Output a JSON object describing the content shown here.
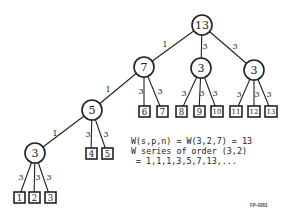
{
  "diagram": {
    "type": "tree",
    "nodes": [
      {
        "id": "n13",
        "label": "13",
        "shape": "circle",
        "x": 202,
        "y": 25
      },
      {
        "id": "n7",
        "label": "7",
        "shape": "circle",
        "x": 144,
        "y": 67
      },
      {
        "id": "n3m",
        "label": "3",
        "shape": "circle",
        "x": 201,
        "y": 68
      },
      {
        "id": "n3r",
        "label": "3",
        "shape": "circle",
        "x": 254,
        "y": 70
      },
      {
        "id": "n5",
        "label": "5",
        "shape": "circle",
        "x": 92,
        "y": 110
      },
      {
        "id": "n3l",
        "label": "3",
        "shape": "circle",
        "x": 35,
        "y": 153
      }
    ],
    "leaves": [
      {
        "label": "1",
        "x": 19,
        "y": 197
      },
      {
        "label": "2",
        "x": 34,
        "y": 197
      },
      {
        "label": "3",
        "x": 50,
        "y": 197
      },
      {
        "label": "4",
        "x": 91,
        "y": 153
      },
      {
        "label": "5",
        "x": 107,
        "y": 153
      },
      {
        "label": "6",
        "x": 144,
        "y": 111
      },
      {
        "label": "7",
        "x": 162,
        "y": 111
      },
      {
        "label": "8",
        "x": 181,
        "y": 111
      },
      {
        "label": "9",
        "x": 199,
        "y": 111
      },
      {
        "label": "10",
        "x": 217,
        "y": 111
      },
      {
        "label": "11",
        "x": 236,
        "y": 111
      },
      {
        "label": "12",
        "x": 254,
        "y": 111
      },
      {
        "label": "13",
        "x": 271,
        "y": 111
      }
    ],
    "edge_labels": {
      "e13_7": "1",
      "e13_3m": "3",
      "e13_3r": "3",
      "e7_5": "1",
      "e7_6": "3",
      "e7_7": "3",
      "e3m_8": "3",
      "e3m_9": "3",
      "e3m_10": "3",
      "e3r_11": "3",
      "e3r_12": "3",
      "e3r_13": "3",
      "e5_3l": "1",
      "e5_4": "3",
      "e5_5": "3",
      "e3l_1": "3",
      "e3l_2": "3",
      "e3l_3": "3"
    }
  },
  "annotations": {
    "line1": "W(s,p,n) = W(3,2,7) = 13",
    "line2": "W series of order (3,2)",
    "line3": "= 1,1,1,3,5,7,13,...",
    "figure_id": "FP-4363"
  }
}
